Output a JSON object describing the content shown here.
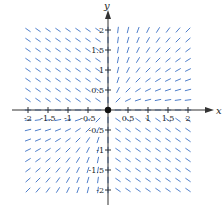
{
  "chart_data": {
    "type": "direction_field",
    "title": "",
    "xlabel": "x",
    "ylabel": "y",
    "xlim": [
      -2,
      2
    ],
    "ylim": [
      -2,
      2
    ],
    "grid": false,
    "origin_marker": true,
    "x_ticks": [
      -2,
      -1.5,
      -1,
      -0.5,
      0.5,
      1,
      1.5,
      2
    ],
    "x_tick_labels": [
      "-2",
      "-1.5",
      "-1",
      "-0.5",
      "0.5",
      "1",
      "1.5",
      "2"
    ],
    "y_ticks": [
      2,
      1.5,
      1,
      0.5,
      -0.5,
      -1,
      -1.5,
      -2
    ],
    "y_tick_labels": [
      "2",
      "1.5",
      "1",
      "0.5",
      "-0.5",
      "-1",
      "-1.5",
      "-2"
    ],
    "sample_step": 0.25,
    "segment_color": "#3a6fc4",
    "axis_color": "#333333"
  },
  "axes": {
    "x_label": "x",
    "y_label": "y"
  }
}
